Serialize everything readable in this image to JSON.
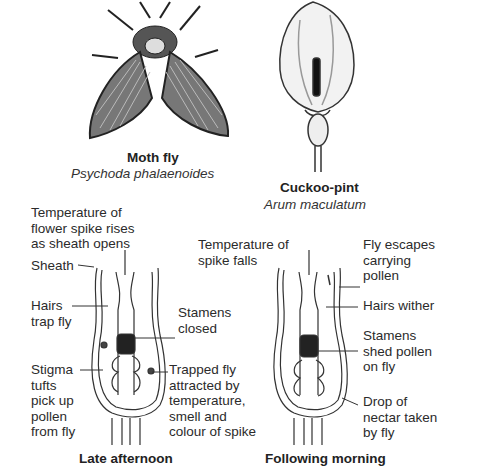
{
  "organisms": {
    "moth_fly": {
      "common_name": "Moth fly",
      "scientific_name": "Psychoda phalaenoides"
    },
    "cuckoo_pint": {
      "common_name": "Cuckoo-pint",
      "scientific_name": "Arum maculatum"
    }
  },
  "late_afternoon": {
    "caption": "Late afternoon",
    "labels": {
      "temperature": "Temperature of\nflower spike rises\nas sheath opens",
      "sheath": "Sheath",
      "hairs": "Hairs\ntrap fly",
      "stamens": "Stamens\nclosed",
      "stigma": "Stigma\ntufts\npick up\npollen\nfrom fly",
      "trapped_fly": "Trapped fly\nattracted by\ntemperature,\nsmell and\ncolour of spike"
    }
  },
  "following_morning": {
    "caption": "Following morning",
    "labels": {
      "temperature": "Temperature of\nspike falls",
      "fly_escapes": "Fly escapes\ncarrying\npollen",
      "hairs": "Hairs wither",
      "stamens": "Stamens\nshed pollen\non fly",
      "nectar": "Drop of\nnectar taken\nby fly"
    }
  }
}
